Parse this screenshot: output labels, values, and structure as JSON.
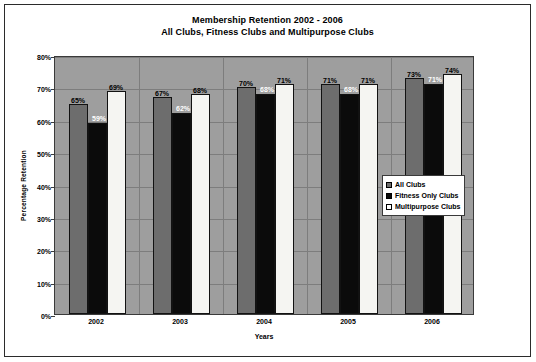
{
  "chart_data": {
    "type": "bar",
    "title": "Membership Retention 2002 - 2006",
    "subtitle": "All Clubs, Fitness Clubs and Multipurpose Clubs",
    "xlabel": "Years",
    "ylabel": "Percentage Retention",
    "categories": [
      "2002",
      "2003",
      "2004",
      "2005",
      "2006"
    ],
    "series": [
      {
        "name": "All Clubs",
        "color": "#6d6d6d",
        "values": [
          65,
          67,
          70,
          71,
          73
        ],
        "labels": [
          "65%",
          "67%",
          "70%",
          "71%",
          "73%"
        ]
      },
      {
        "name": "Fitness Only Clubs",
        "color": "#0b0b0b",
        "values": [
          59,
          62,
          68,
          68,
          71
        ],
        "labels": [
          "59%",
          "62%",
          "68%",
          "68%",
          "71%"
        ]
      },
      {
        "name": "Multipurpose Clubs",
        "color": "#f5f5f2",
        "values": [
          69,
          68,
          71,
          71,
          74
        ],
        "labels": [
          "69%",
          "68%",
          "71%",
          "71%",
          "74%"
        ]
      }
    ],
    "ylim": [
      0,
      80
    ],
    "ytick_labels": [
      "0%",
      "10%",
      "20%",
      "30%",
      "40%",
      "50%",
      "60%",
      "70%",
      "80%"
    ],
    "ytick_values": [
      0,
      10,
      20,
      30,
      40,
      50,
      60,
      70,
      80
    ],
    "grid": true,
    "legend_position": "right-inside",
    "plot_background": "#9e9e9e"
  }
}
